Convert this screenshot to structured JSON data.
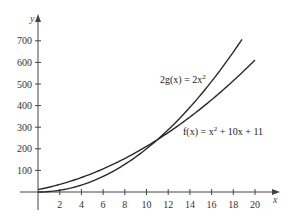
{
  "chart_data": {
    "type": "line",
    "title": "",
    "xlabel": "x",
    "ylabel": "y",
    "xlim": [
      0,
      21
    ],
    "ylim": [
      0,
      750
    ],
    "x_ticks": [
      2,
      4,
      6,
      8,
      10,
      12,
      14,
      16,
      18,
      20
    ],
    "x_tick_labels": [
      "2",
      "4",
      "6",
      "8",
      "10",
      "12",
      "14",
      "16",
      "18",
      "20"
    ],
    "y_ticks": [
      100,
      200,
      300,
      400,
      500,
      600,
      700
    ],
    "y_tick_labels": [
      "100",
      "200",
      "300",
      "400",
      "500",
      "600",
      "700"
    ],
    "grid": false,
    "legend": "none",
    "series": [
      {
        "name": "f(x) = x^2 + 10x + 11",
        "label": "f(x) = x² + 10x + 11",
        "formula": "x^2 + 10x + 11",
        "x": [
          0,
          2,
          4,
          6,
          8,
          10,
          11,
          12,
          14,
          16,
          18,
          20
        ],
        "values": [
          11,
          35,
          67,
          107,
          155,
          211,
          242,
          275,
          347,
          427,
          515,
          611
        ]
      },
      {
        "name": "2g(x) = 2x^2",
        "label": "2g(x) = 2x²",
        "formula": "2x^2",
        "x": [
          0,
          2,
          4,
          6,
          8,
          10,
          11,
          12,
          14,
          16,
          18,
          18.8
        ],
        "values": [
          0,
          8,
          32,
          72,
          128,
          200,
          242,
          288,
          392,
          512,
          648,
          707
        ]
      }
    ],
    "annotations": [
      {
        "text": "2g(x) = 2x²",
        "near": "upper curve, x≈11-16"
      },
      {
        "text": "f(x) = x² + 10x + 11",
        "near": "lower curve, x≈13-21"
      }
    ],
    "intersection": {
      "x": 11,
      "y": 242
    }
  },
  "labels": {
    "x_axis": "x",
    "y_axis": "y",
    "g_label_main": "2g(x) = 2x",
    "g_label_sup": "2",
    "f_label_pre": "f(x) = x",
    "f_label_sup": "2",
    "f_label_post": " + 10x + 11"
  },
  "colors": {
    "axis": "#444444",
    "curve": "#2a2a2a",
    "background": "#ffffff"
  }
}
